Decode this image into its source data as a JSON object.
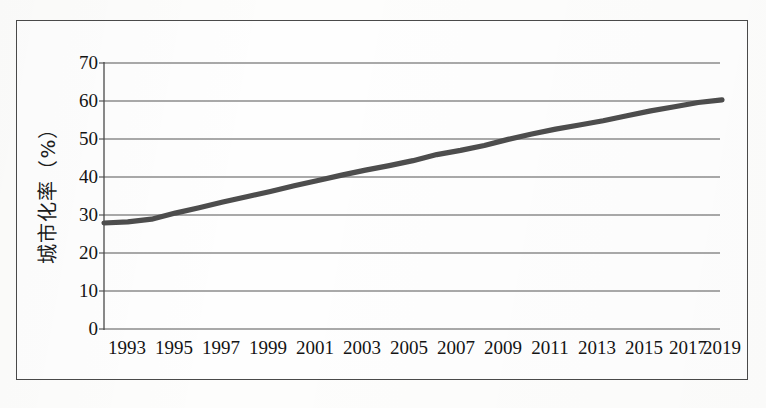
{
  "chart_data": {
    "type": "line",
    "title": "",
    "subtitle": "",
    "xlabel": "",
    "ylabel": "城市化率（%）",
    "ylim": [
      0,
      70
    ],
    "yticks": [
      0,
      10,
      20,
      30,
      40,
      50,
      60,
      70
    ],
    "ytick_labels": [
      "0",
      "10",
      "20",
      "30",
      "40",
      "50",
      "60",
      "70"
    ],
    "xlim": [
      1993,
      2019
    ],
    "xticks": [
      1993,
      1995,
      1997,
      1999,
      2001,
      2003,
      2005,
      2007,
      2009,
      2011,
      2013,
      2015,
      2017,
      2019
    ],
    "xtick_labels": [
      "1993",
      "1995",
      "1997",
      "1999",
      "2001",
      "2003",
      "2005",
      "2007",
      "2009",
      "2011",
      "2013",
      "2015",
      "2017",
      "2019"
    ],
    "grid": "horizontal",
    "legend": "none",
    "series": [
      {
        "name": "城市化率",
        "color": "#4d4d4d",
        "x": [
          1993,
          1994,
          1995,
          1996,
          1997,
          1998,
          1999,
          2000,
          2001,
          2002,
          2003,
          2004,
          2005,
          2006,
          2007,
          2008,
          2009,
          2010,
          2011,
          2012,
          2013,
          2014,
          2015,
          2016,
          2017,
          2018,
          2019
        ],
        "values": [
          27.9,
          28.2,
          28.9,
          30.5,
          31.9,
          33.4,
          34.8,
          36.2,
          37.7,
          39.1,
          40.5,
          41.8,
          43.0,
          44.3,
          45.9,
          47.0,
          48.3,
          49.9,
          51.3,
          52.6,
          53.7,
          54.8,
          56.1,
          57.4,
          58.5,
          59.6,
          60.3
        ]
      }
    ],
    "annotations": []
  },
  "figure": {
    "frame_color": "#4a4a4a",
    "background_color": "#fefefe",
    "gridline_color": "#6a6a6a",
    "axis_color": "#4a4a4a",
    "line_color": "#4d4d4d"
  }
}
